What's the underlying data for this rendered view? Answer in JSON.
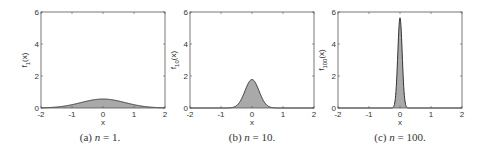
{
  "chart_data": [
    {
      "type": "area",
      "title": "",
      "caption": {
        "prefix": "(a)",
        "var": "n",
        "eq": "= 1."
      },
      "xlabel": "x",
      "ylabel": {
        "base": "f",
        "sub": "1",
        "suffix": "(x)"
      },
      "xlim": [
        -2,
        2
      ],
      "ylim": [
        0,
        6
      ],
      "xticks": [
        -2,
        -1,
        0,
        1,
        2
      ],
      "yticks": [
        0,
        2,
        4,
        6
      ],
      "grid": false,
      "n": 1,
      "peak": 0.56,
      "sigma": 0.71,
      "fill_color": "#a9a9a9",
      "line_color": "#333333"
    },
    {
      "type": "area",
      "title": "",
      "caption": {
        "prefix": "(b)",
        "var": "n",
        "eq": "= 10."
      },
      "xlabel": "x",
      "ylabel": {
        "base": "f",
        "sub": "10",
        "suffix": "(x)"
      },
      "xlim": [
        -2,
        2
      ],
      "ylim": [
        0,
        6
      ],
      "xticks": [
        -2,
        -1,
        0,
        1,
        2
      ],
      "yticks": [
        0,
        2,
        4,
        6
      ],
      "grid": false,
      "n": 10,
      "peak": 1.78,
      "sigma": 0.224,
      "fill_color": "#a9a9a9",
      "line_color": "#333333"
    },
    {
      "type": "area",
      "title": "",
      "caption": {
        "prefix": "(c)",
        "var": "n",
        "eq": "= 100."
      },
      "xlabel": "x",
      "ylabel": {
        "base": "f",
        "sub": "100",
        "suffix": "(x)"
      },
      "xlim": [
        -2,
        2
      ],
      "ylim": [
        0,
        6
      ],
      "xticks": [
        -2,
        -1,
        0,
        1,
        2
      ],
      "yticks": [
        0,
        2,
        4,
        6
      ],
      "grid": false,
      "n": 100,
      "peak": 5.64,
      "sigma": 0.0707,
      "fill_color": "#a9a9a9",
      "line_color": "#333333"
    }
  ]
}
